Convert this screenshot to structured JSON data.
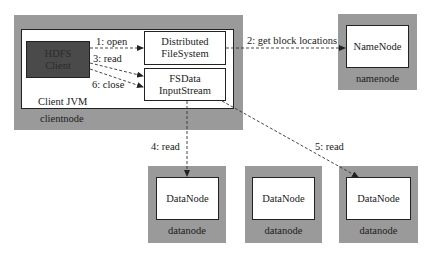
{
  "diagram": {
    "clientnode": {
      "node_label": "clientnode",
      "jvm_label": "Client JVM",
      "hdfs_client": "HDFS\nClient",
      "distributed_fs": "Distributed\nFileSystem",
      "fsdata_stream": "FSData\nInputStream"
    },
    "namenode": {
      "node_label": "namenode",
      "component": "NameNode"
    },
    "datanodes": [
      {
        "node_label": "datanode",
        "component": "DataNode"
      },
      {
        "node_label": "datanode",
        "component": "DataNode"
      },
      {
        "node_label": "datanode",
        "component": "DataNode"
      }
    ],
    "edges": [
      {
        "label": "1: open",
        "from": "HDFS Client",
        "to": "DistributedFileSystem"
      },
      {
        "label": "2: get block locations",
        "from": "DistributedFileSystem",
        "to": "NameNode"
      },
      {
        "label": "3: read",
        "from": "HDFS Client",
        "to": "FSDataInputStream"
      },
      {
        "label": "4: read",
        "from": "FSDataInputStream",
        "to": "DataNode 1"
      },
      {
        "label": "5: read",
        "from": "FSDataInputStream",
        "to": "DataNode 3"
      },
      {
        "label": "6: close",
        "from": "HDFS Client",
        "to": "FSDataInputStream"
      }
    ],
    "colors": {
      "node_fill": "#9a9a9a",
      "client_fill": "#4a4a4a",
      "box_fill": "#ffffff",
      "line": "#222222"
    }
  }
}
